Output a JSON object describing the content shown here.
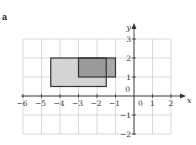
{
  "figure_label": "a",
  "axes": {
    "x_label": "x",
    "y_label": "y",
    "x_range": [
      -6,
      2
    ],
    "y_range": [
      -2,
      3
    ],
    "x_ticks": [
      "-6",
      "-5",
      "-4",
      "-3",
      "-2",
      "-1",
      "0",
      "1",
      "2"
    ],
    "y_ticks": [
      "3",
      "2",
      "1",
      "0",
      "-1",
      "-2"
    ],
    "x_tick_values": [
      -6,
      -5,
      -4,
      -3,
      -2,
      -1,
      1,
      2
    ],
    "y_tick_values": [
      3,
      2,
      1,
      -1,
      -2
    ],
    "origin_label": "0"
  },
  "shapes": [
    {
      "name": "light-rectangle",
      "x1": -4.5,
      "x2": -1.5,
      "y1": 0.5,
      "y2": 2,
      "fill": "#d4d4d4",
      "stroke": "#333333"
    },
    {
      "name": "dark-rectangle",
      "x1": -3,
      "x2": -1,
      "y1": 1,
      "y2": 2,
      "fill": "#a8a8a8",
      "stroke": "#333333"
    }
  ],
  "colors": {
    "grid": "#cfcfcf",
    "axis": "#333333",
    "overlap": "#9a9a9a"
  }
}
